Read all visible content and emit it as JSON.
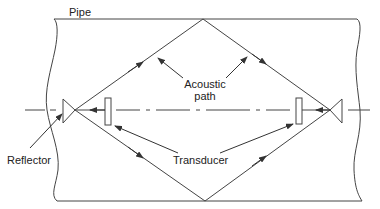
{
  "diagram": {
    "labels": {
      "pipe": "Pipe",
      "acoustic_path_line1": "Acoustic",
      "acoustic_path_line2": "path",
      "reflector": "Reflector",
      "transducer": "Transducer"
    },
    "colors": {
      "stroke": "#333333",
      "background": "#ffffff"
    },
    "components": [
      {
        "id": "pipe",
        "type": "pipe-wall"
      },
      {
        "id": "left-reflector",
        "type": "reflector"
      },
      {
        "id": "right-reflector",
        "type": "reflector"
      },
      {
        "id": "left-transducer",
        "type": "transducer"
      },
      {
        "id": "right-transducer",
        "type": "transducer"
      },
      {
        "id": "acoustic-path",
        "type": "diamond-path"
      },
      {
        "id": "pipe-centerline",
        "type": "dash-dot-line"
      }
    ]
  }
}
